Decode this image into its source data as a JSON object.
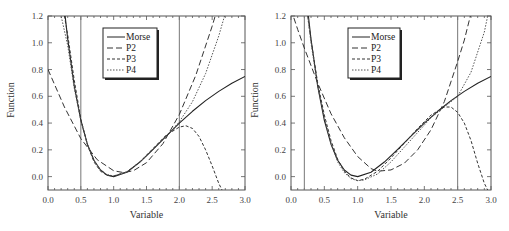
{
  "chart_data": [
    {
      "type": "line",
      "panel": "left",
      "title": "",
      "xlabel": "Variable",
      "ylabel": "Function",
      "xlim": [
        0.0,
        3.0
      ],
      "ylim": [
        -0.1,
        1.2
      ],
      "xticks": [
        "0.0",
        "0.5",
        "1.0",
        "1.5",
        "2.0",
        "2.5",
        "3.0"
      ],
      "xtick_values": [
        0,
        0.5,
        1,
        1.5,
        2,
        2.5,
        3
      ],
      "yticks": [
        "0.0",
        "0.2",
        "0.4",
        "0.6",
        "0.8",
        "1.0",
        "1.2"
      ],
      "ytick_values": [
        0,
        0.2,
        0.4,
        0.6,
        0.8,
        1.0,
        1.2
      ],
      "vlines": [
        0.5,
        2.0
      ],
      "grid": false,
      "legend_position": "top-center",
      "series": [
        {
          "name": "Morse",
          "style": "solid",
          "x": [
            0.2,
            0.25,
            0.3,
            0.4,
            0.5,
            0.6,
            0.7,
            0.8,
            0.9,
            1.0,
            1.2,
            1.4,
            1.6,
            1.8,
            2.0,
            2.2,
            2.4,
            2.6,
            2.8,
            3.0
          ],
          "y": [
            1.502,
            1.248,
            1.028,
            0.676,
            0.421,
            0.242,
            0.122,
            0.049,
            0.011,
            0.0,
            0.033,
            0.109,
            0.204,
            0.303,
            0.4,
            0.488,
            0.568,
            0.637,
            0.697,
            0.748
          ]
        },
        {
          "name": "P2",
          "style": "long-dash",
          "x": [
            0.0,
            0.25,
            0.5,
            0.75,
            1.0,
            1.15,
            1.3,
            1.5,
            1.75,
            2.0,
            2.25,
            2.5,
            2.6
          ],
          "y": [
            0.8,
            0.52,
            0.284,
            0.126,
            0.044,
            0.03,
            0.044,
            0.104,
            0.246,
            0.464,
            0.756,
            1.124,
            1.29
          ]
        },
        {
          "name": "P3",
          "style": "short-dash",
          "x": [
            0.2,
            0.25,
            0.3,
            0.4,
            0.5,
            0.6,
            0.7,
            0.8,
            0.9,
            1.0,
            1.2,
            1.4,
            1.6,
            1.8,
            2.0,
            2.1,
            2.2,
            2.3,
            2.4,
            2.5,
            2.6,
            2.65
          ],
          "y": [
            1.35,
            1.2,
            1.06,
            0.72,
            0.43,
            0.24,
            0.11,
            0.04,
            0.01,
            0.005,
            0.035,
            0.11,
            0.21,
            0.31,
            0.37,
            0.38,
            0.36,
            0.3,
            0.2,
            0.08,
            -0.05,
            -0.1
          ]
        },
        {
          "name": "P4",
          "style": "dotted",
          "x": [
            0.15,
            0.2,
            0.3,
            0.4,
            0.5,
            0.6,
            0.7,
            0.8,
            0.9,
            1.0,
            1.2,
            1.4,
            1.6,
            1.8,
            2.0,
            2.2,
            2.4,
            2.6,
            2.7
          ],
          "y": [
            1.35,
            1.2,
            0.98,
            0.66,
            0.42,
            0.24,
            0.12,
            0.05,
            0.015,
            0.005,
            0.035,
            0.11,
            0.2,
            0.3,
            0.41,
            0.56,
            0.77,
            1.05,
            1.22
          ]
        }
      ]
    },
    {
      "type": "line",
      "panel": "right",
      "title": "",
      "xlabel": "Variable",
      "ylabel": "Function",
      "xlim": [
        0.0,
        3.0
      ],
      "ylim": [
        -0.1,
        1.2
      ],
      "xticks": [
        "0.0",
        "0.5",
        "1.0",
        "1.5",
        "2.0",
        "2.5",
        "3.0"
      ],
      "xtick_values": [
        0,
        0.5,
        1,
        1.5,
        2,
        2.5,
        3
      ],
      "yticks": [
        "0.0",
        "0.2",
        "0.4",
        "0.6",
        "0.8",
        "1.0",
        "1.2"
      ],
      "ytick_values": [
        0,
        0.2,
        0.4,
        0.6,
        0.8,
        1.0,
        1.2
      ],
      "vlines": [
        0.2,
        2.5
      ],
      "grid": false,
      "legend_position": "top-center",
      "series": [
        {
          "name": "Morse",
          "style": "solid",
          "x": [
            0.2,
            0.25,
            0.3,
            0.4,
            0.5,
            0.6,
            0.7,
            0.8,
            0.9,
            1.0,
            1.2,
            1.4,
            1.6,
            1.8,
            2.0,
            2.2,
            2.4,
            2.6,
            2.8,
            3.0
          ],
          "y": [
            1.502,
            1.248,
            1.028,
            0.676,
            0.421,
            0.242,
            0.122,
            0.049,
            0.011,
            0.0,
            0.033,
            0.109,
            0.204,
            0.303,
            0.4,
            0.488,
            0.568,
            0.637,
            0.697,
            0.748
          ]
        },
        {
          "name": "P2",
          "style": "long-dash",
          "x": [
            0.0,
            0.1,
            0.2,
            0.4,
            0.6,
            0.8,
            1.0,
            1.2,
            1.3,
            1.5,
            1.7,
            1.9,
            2.1,
            2.3,
            2.5,
            2.6,
            2.7
          ],
          "y": [
            1.25,
            1.1,
            0.96,
            0.7,
            0.47,
            0.29,
            0.15,
            0.06,
            0.04,
            0.05,
            0.1,
            0.2,
            0.35,
            0.56,
            0.86,
            1.02,
            1.22
          ]
        },
        {
          "name": "P3",
          "style": "short-dash",
          "x": [
            0.2,
            0.25,
            0.3,
            0.4,
            0.5,
            0.6,
            0.7,
            0.8,
            0.9,
            1.0,
            1.1,
            1.3,
            1.5,
            1.7,
            1.9,
            2.1,
            2.3,
            2.4,
            2.5,
            2.6,
            2.7,
            2.8,
            2.9,
            2.95
          ],
          "y": [
            1.5,
            1.2,
            1.02,
            0.7,
            0.46,
            0.27,
            0.13,
            0.04,
            -0.01,
            -0.03,
            -0.02,
            0.04,
            0.14,
            0.25,
            0.36,
            0.46,
            0.52,
            0.52,
            0.48,
            0.4,
            0.27,
            0.1,
            -0.05,
            -0.1
          ]
        },
        {
          "name": "P4",
          "style": "dotted",
          "x": [
            0.2,
            0.25,
            0.3,
            0.4,
            0.5,
            0.6,
            0.7,
            0.8,
            0.9,
            1.0,
            1.1,
            1.3,
            1.5,
            1.7,
            1.9,
            2.1,
            2.3,
            2.5,
            2.7,
            2.9,
            2.95
          ],
          "y": [
            1.45,
            1.2,
            1.0,
            0.68,
            0.44,
            0.25,
            0.11,
            0.03,
            -0.015,
            -0.03,
            -0.025,
            0.02,
            0.11,
            0.22,
            0.33,
            0.44,
            0.52,
            0.6,
            0.78,
            1.08,
            1.2
          ]
        }
      ]
    }
  ]
}
